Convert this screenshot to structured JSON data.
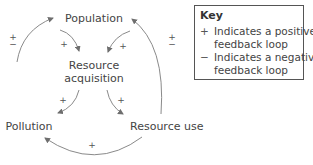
{
  "diagram": {
    "nodes": {
      "population": "Population",
      "resource_acquisition_line1": "Resource",
      "resource_acquisition_line2": "acquisition",
      "pollution": "Pollution",
      "resource_use": "Resource use"
    },
    "links": [
      {
        "from": "Population",
        "to": "Resource acquisition",
        "sign": "+"
      },
      {
        "from": "Resource use",
        "to": "Resource acquisition",
        "sign": "+"
      },
      {
        "from": "Resource acquisition",
        "to": "Pollution",
        "sign": "+"
      },
      {
        "from": "Resource acquisition",
        "to": "Resource use",
        "sign": "+"
      },
      {
        "from": "Resource use",
        "to": "Pollution",
        "sign": "+"
      },
      {
        "from": "Pollution",
        "to": "Population",
        "sign": "±"
      },
      {
        "from": "Resource use",
        "to": "Population",
        "sign": "±"
      }
    ],
    "signs": {
      "pop_to_acq": "+",
      "use_to_acq": "+",
      "acq_to_poll": "+",
      "acq_to_use": "+",
      "use_to_poll": "+",
      "plus": "+",
      "minus": "−"
    },
    "arrow_color": "#7a7a7a"
  },
  "key": {
    "title": "Key",
    "items": [
      {
        "symbol": "+",
        "line1": "Indicates a positive",
        "line2": "feedback loop"
      },
      {
        "symbol": "−",
        "line1": "Indicates a negative",
        "line2": "feedback loop"
      }
    ]
  }
}
